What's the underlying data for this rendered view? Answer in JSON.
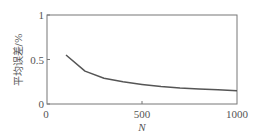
{
  "chart_data": {
    "type": "line",
    "title": "",
    "xlabel": "N",
    "ylabel": "平均误差/%",
    "xlim": [
      0,
      1000
    ],
    "ylim": [
      0,
      1
    ],
    "xticks": [
      0,
      500,
      1000
    ],
    "xtick_labels": [
      "0",
      "500",
      "1000"
    ],
    "yticks": [
      0,
      0.5,
      1
    ],
    "ytick_labels": [
      "0",
      "0.5",
      "1"
    ],
    "grid": false,
    "legend": null,
    "series": [
      {
        "name": "平均误差",
        "color": "#555555",
        "x": [
          100,
          200,
          300,
          400,
          500,
          600,
          700,
          800,
          900,
          1000
        ],
        "y": [
          0.55,
          0.37,
          0.29,
          0.25,
          0.22,
          0.195,
          0.18,
          0.17,
          0.16,
          0.15
        ]
      }
    ]
  },
  "colors": {
    "axis": "#666666",
    "line": "#555555",
    "text": "#555555"
  }
}
